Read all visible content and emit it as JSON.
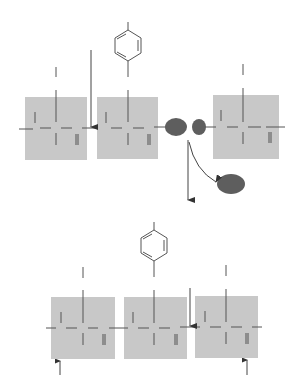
{
  "diagram": {
    "title": "",
    "colors": {
      "unit_box": "#c8c8c8",
      "line": "#555555",
      "fragment": "#5e5e5e",
      "background": "#ffffff"
    },
    "top_panel": {
      "units": [
        "unit-1",
        "unit-2-phenyl",
        "unit-3"
      ],
      "fragments": [
        "fragment-large",
        "fragment-small",
        "released-fragment"
      ],
      "arrows": [
        "insertion-arrow",
        "downward-arrow",
        "release-arrow"
      ]
    },
    "bottom_panel": {
      "units": [
        "unit-1",
        "unit-2-phenyl",
        "unit-3"
      ],
      "arrows": [
        "insertion-arrow",
        "left-end-marker-arrow",
        "right-end-marker-arrow"
      ]
    }
  }
}
